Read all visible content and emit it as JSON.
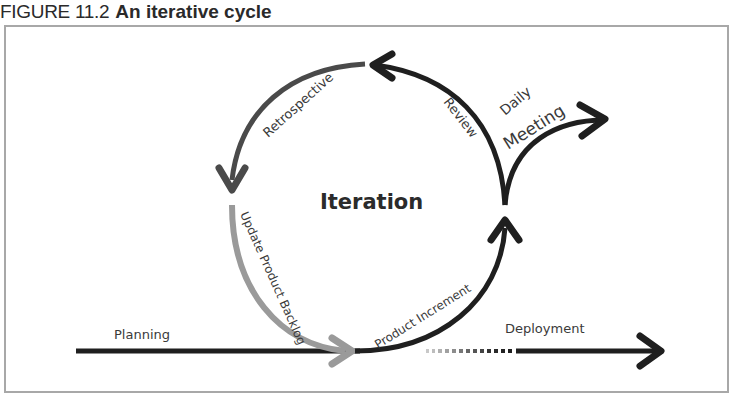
{
  "figure": {
    "number": "FIGURE 11.2",
    "title": "An iterative cycle"
  },
  "diagram": {
    "center_label": "Iteration",
    "labels": {
      "retrospective": "Retrospective",
      "review": "Review",
      "daily": "Daily",
      "meeting": "Meeting",
      "update_backlog": "Update Product Backlog",
      "product_increment": "Product Increment",
      "planning": "Planning",
      "deployment": "Deployment"
    },
    "colors": {
      "dark": "#1f1f1f",
      "mid": "#4a4a4a",
      "light": "#9a9a9a",
      "frame": "#a8a8a8"
    }
  }
}
